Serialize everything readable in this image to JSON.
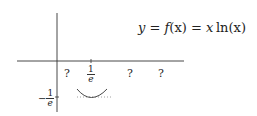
{
  "formula": {
    "lhs": "y",
    "eq1": " = ",
    "fname": "f",
    "arg": "(x)",
    "eq2": " = ",
    "x": "x",
    "ln": "ln",
    "ln_arg": "(x)"
  },
  "x_axis": {
    "tick_label_num": "1",
    "tick_label_den": "e",
    "unknown_labels": [
      "?",
      "?",
      "?"
    ]
  },
  "y_axis": {
    "tick_label_sign": "−",
    "tick_label_num": "1",
    "tick_label_den": "e"
  },
  "colors": {
    "axis": "#333333",
    "curve": "#333333",
    "dotted": "#888888"
  }
}
